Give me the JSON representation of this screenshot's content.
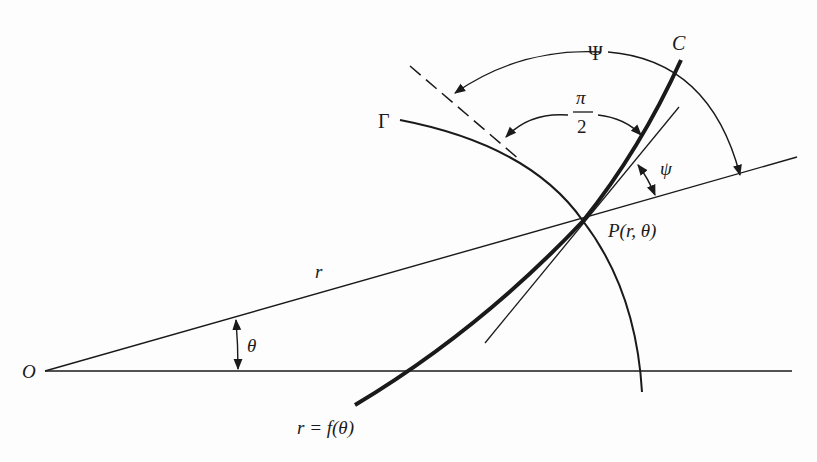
{
  "figure": {
    "labels": {
      "origin": "O",
      "radius": "r",
      "theta": "θ",
      "point": "P(r, θ)",
      "curve_c": "C",
      "curve_gamma": "Γ",
      "big_psi": "Ψ",
      "small_psi": "ψ",
      "pi_num": "π",
      "pi_den": "2",
      "equation": "r = f(θ)"
    },
    "colors": {
      "ink": "#1a1a1a",
      "background": "#fdfdfd"
    }
  }
}
